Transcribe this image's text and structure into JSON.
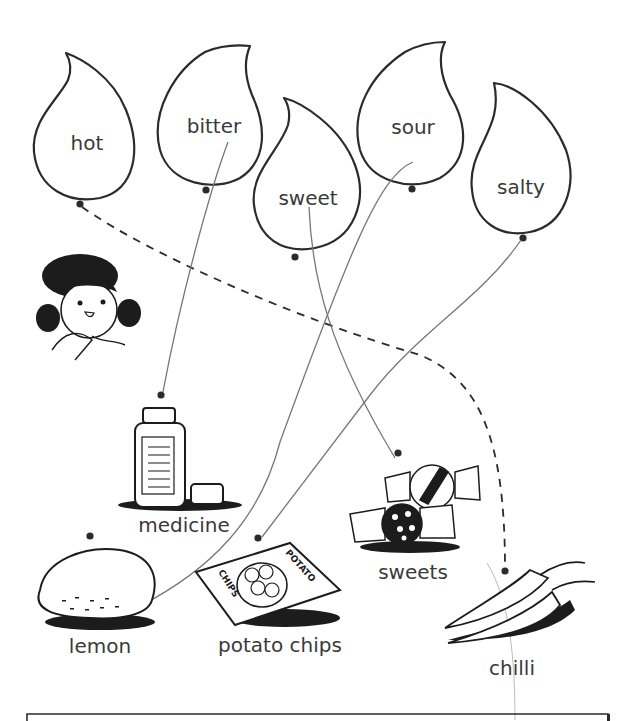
{
  "tastes": [
    {
      "id": "hot",
      "label": "hot"
    },
    {
      "id": "bitter",
      "label": "bitter"
    },
    {
      "id": "sweet",
      "label": "sweet"
    },
    {
      "id": "sour",
      "label": "sour"
    },
    {
      "id": "salty",
      "label": "salty"
    }
  ],
  "foods": [
    {
      "id": "medicine",
      "label": "medicine"
    },
    {
      "id": "lemon",
      "label": "lemon"
    },
    {
      "id": "potato_chips",
      "label": "potato chips"
    },
    {
      "id": "sweets",
      "label": "sweets"
    },
    {
      "id": "chilli",
      "label": "chilli"
    }
  ],
  "chips_bag_text": {
    "top": "POTATO",
    "side": "CHIPS"
  },
  "matches": [
    {
      "taste": "hot",
      "food": "chilli",
      "style": "dashed example"
    },
    {
      "taste": "bitter",
      "food": "medicine",
      "style": "hand-drawn line"
    },
    {
      "taste": "sweet",
      "food": "sweets",
      "style": "hand-drawn line"
    },
    {
      "taste": "sour",
      "food": "lemon",
      "style": "hand-drawn line"
    },
    {
      "taste": "salty",
      "food": "potato chips",
      "style": "hand-drawn line"
    }
  ],
  "colors": {
    "ink": "#2b2b2b",
    "pencil": "#777777",
    "text": "#3a3a3a"
  }
}
